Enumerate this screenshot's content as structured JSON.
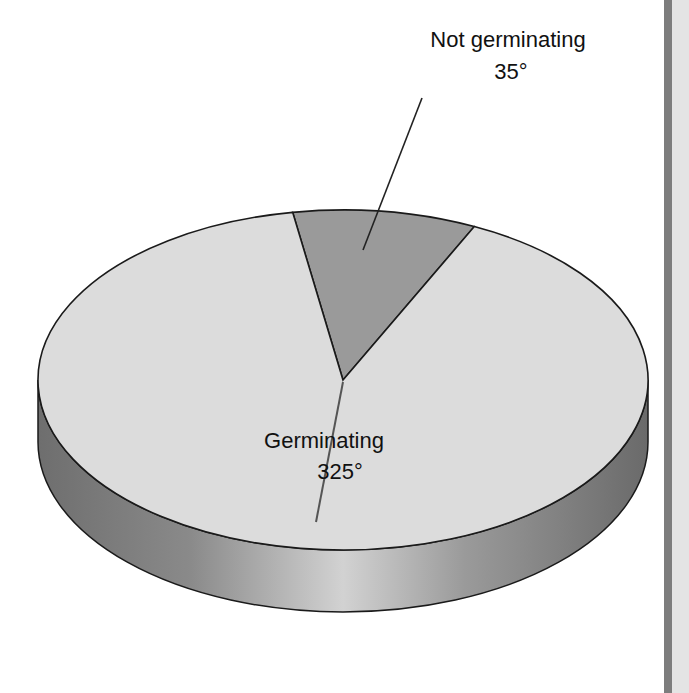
{
  "chart_data": {
    "type": "pie",
    "style": "3d",
    "title": "",
    "units": "degrees",
    "total": 360,
    "slices": [
      {
        "label": "Germinating",
        "value": 325,
        "value_label": "325°",
        "color": "#dcdcdc"
      },
      {
        "label": "Not germinating",
        "value": 35,
        "value_label": "35°",
        "color": "#9a9a9a"
      }
    ],
    "legend": "none",
    "data_labels": "leader-lines",
    "colors": {
      "outline": "#1a1a1a",
      "side_dark": "#707070",
      "side_light": "#c8c8c8",
      "leader": "#333333"
    }
  }
}
